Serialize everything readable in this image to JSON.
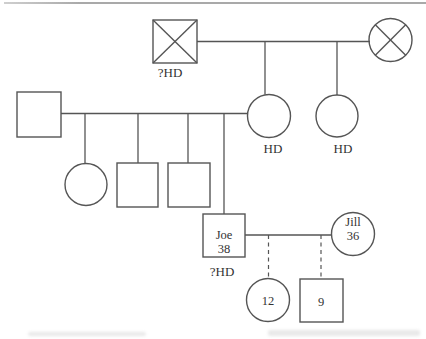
{
  "figure": {
    "kind": "pedigree-chart",
    "individuals": [
      {
        "id": "I-1",
        "symbol": "square-crossed",
        "sex": "male",
        "deceased": true,
        "label": "?HD"
      },
      {
        "id": "I-2",
        "symbol": "circle-crossed",
        "sex": "female",
        "deceased": true,
        "label": ""
      },
      {
        "id": "II-1",
        "symbol": "square",
        "sex": "male",
        "deceased": false,
        "label": ""
      },
      {
        "id": "II-2",
        "symbol": "circle",
        "sex": "female",
        "deceased": false,
        "label": "HD"
      },
      {
        "id": "II-3",
        "symbol": "circle",
        "sex": "female",
        "deceased": false,
        "label": "HD"
      },
      {
        "id": "III-1",
        "symbol": "circle",
        "sex": "female",
        "deceased": false,
        "label": ""
      },
      {
        "id": "III-2",
        "symbol": "square",
        "sex": "male",
        "deceased": false,
        "label": ""
      },
      {
        "id": "III-3",
        "symbol": "square",
        "sex": "male",
        "deceased": false,
        "label": ""
      },
      {
        "id": "III-4",
        "symbol": "square",
        "sex": "male",
        "deceased": false,
        "name": "Joe",
        "age": "38",
        "label": "?HD"
      },
      {
        "id": "III-5",
        "symbol": "circle",
        "sex": "female",
        "deceased": false,
        "name": "Jill",
        "age": "36",
        "label": ""
      },
      {
        "id": "IV-1",
        "symbol": "circle",
        "sex": "female",
        "deceased": false,
        "age": "12",
        "label": ""
      },
      {
        "id": "IV-2",
        "symbol": "square",
        "sex": "male",
        "deceased": false,
        "age": "9",
        "label": ""
      }
    ],
    "relationships": {
      "gen1_couple_children_labels": [
        "HD",
        "HD"
      ],
      "joe_jill_children_ages": [
        "12",
        "9"
      ],
      "uncertain_link_style": "dashed"
    }
  },
  "colors": {
    "background": "#ffffff",
    "line": "#555555",
    "text": "#333333",
    "rule": "#a9a9a9"
  }
}
